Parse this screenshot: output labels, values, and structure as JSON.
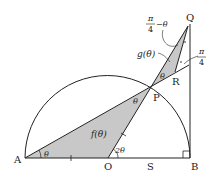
{
  "diagram": {
    "type": "geometry",
    "colors": {
      "stroke": "#222222",
      "shade": "#c8c8c8",
      "background": "#ffffff"
    },
    "points": {
      "A": {
        "label": "A"
      },
      "O": {
        "label": "O"
      },
      "S": {
        "label": "S"
      },
      "B": {
        "label": "B"
      },
      "P": {
        "label": "P"
      },
      "Q": {
        "label": "Q"
      },
      "R": {
        "label": "R"
      }
    },
    "annotations": {
      "theta_A": "θ",
      "theta_P_lower": "θ",
      "theta_P_upper": "θ",
      "two_theta_O": "2θ",
      "f_area": "f(θ)",
      "g_area": "g(θ)",
      "pi_over_4_minus_theta": {
        "numerator": "π",
        "denominator": "4",
        "suffix": "−θ"
      },
      "pi_over_4": {
        "numerator": "π",
        "denominator": "4"
      }
    }
  }
}
